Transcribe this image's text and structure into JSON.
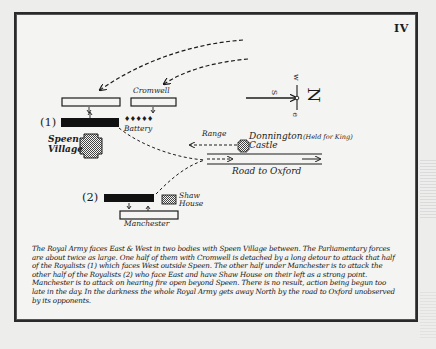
{
  "plate": {
    "number": "IV"
  },
  "compass": {
    "north": "N",
    "south": "S",
    "east": "e",
    "west": "w"
  },
  "map": {
    "labels": {
      "cromwell": "Cromwell",
      "battery": "Battery",
      "group1": "(1)",
      "group2": "(2)",
      "speen_line1": "Speen",
      "speen_line2": "Village",
      "range": "Range",
      "donnington": "Donnington",
      "donnington_note": "(Held for King)",
      "castle": "Castle",
      "road": "Road to Oxford",
      "shaw_line1": "Shaw",
      "shaw_line2": "House",
      "manchester": "Manchester",
      "battery_glyphs": "♦♦♦♦♦"
    },
    "colors": {
      "ink": "#1c1c1c",
      "paper": "#f4f4f2",
      "hatch": "#6a6a6a"
    }
  },
  "caption": {
    "text": "The Royal Army faces East & West in two bodies with Speen Village between.  The Parliamentary forces are about twice as large.  One half of them with Cromwell is detached by a long detour to attack that half of the Royalists (1) which faces West outside Speen. The other half under Manchester is to attack the other half of the Royalists (2) who face East and have Shaw House on their left as a strong point. Manchester is to attack on hearing fire open beyond Speen. There is no result, action being begun too late in the day. In the darkness the whole Royal Army gets away North by the road to Oxford unobserved by its opponents."
  }
}
